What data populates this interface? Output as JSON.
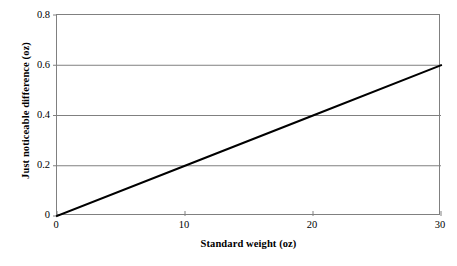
{
  "chart_data": {
    "type": "line",
    "title": "",
    "subtitle": "",
    "xlabel": "Standard weight (oz)",
    "ylabel": "Just noticeable difference (oz)",
    "xlim": [
      0,
      30
    ],
    "ylim": [
      0,
      0.8
    ],
    "xticks": [
      0,
      10,
      20,
      30
    ],
    "xtick_labels": [
      "0",
      "10",
      "20",
      "30"
    ],
    "yticks": [
      0,
      0.2,
      0.4,
      0.6,
      0.8
    ],
    "ytick_labels": [
      "0",
      "0.2",
      "0.4",
      "0.6",
      "0.8"
    ],
    "grid": "horizontal",
    "gridlines_y": [
      0.2,
      0.4,
      0.6
    ],
    "legend": null,
    "legend_position": "none",
    "annotations": [],
    "series": [
      {
        "name": "Weber's law (k = 0.02)",
        "color": "#000000",
        "line_width": 2,
        "x": [
          0,
          10,
          20,
          30
        ],
        "values": [
          0,
          0.2,
          0.4,
          0.6
        ]
      }
    ],
    "colors": {
      "line": "#000000",
      "grid": "#808080",
      "axis": "#808080",
      "background": "#ffffff",
      "text": "#000000"
    }
  }
}
